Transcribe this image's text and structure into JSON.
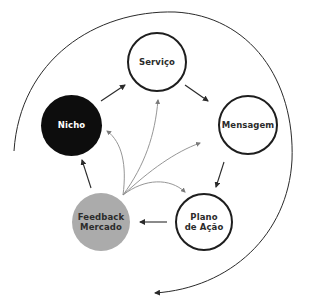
{
  "diagram": {
    "nodes": [
      {
        "id": "servico",
        "label": "Serviço",
        "style": "outline"
      },
      {
        "id": "mensagem",
        "label": "Mensagem",
        "style": "outline"
      },
      {
        "id": "plano",
        "label_line1": "Plano",
        "label_line2": "de Ação",
        "style": "outline"
      },
      {
        "id": "feedback",
        "label_line1": "Feedback",
        "label_line2": "Mercado",
        "style": "filled-gray"
      },
      {
        "id": "nicho",
        "label": "Nicho",
        "style": "filled-black"
      }
    ],
    "cycle_edges": [
      {
        "from": "nicho",
        "to": "servico"
      },
      {
        "from": "servico",
        "to": "mensagem"
      },
      {
        "from": "mensagem",
        "to": "plano"
      },
      {
        "from": "plano",
        "to": "feedback"
      },
      {
        "from": "feedback",
        "to": "nicho"
      }
    ],
    "feedback_edges": [
      {
        "from": "feedback",
        "to": "nicho"
      },
      {
        "from": "feedback",
        "to": "servico"
      },
      {
        "from": "feedback",
        "to": "mensagem"
      },
      {
        "from": "feedback",
        "to": "plano"
      }
    ],
    "outer_arc": "clockwise cycle arrow around diagram",
    "colors": {
      "outline": "#1e1e1e",
      "nicho_fill": "#0d0d0d",
      "feedback_fill": "#ababab",
      "feedback_arrows": "#8a8a8a",
      "text_dark": "#2b2b2b",
      "text_light": "#ffffff"
    }
  }
}
